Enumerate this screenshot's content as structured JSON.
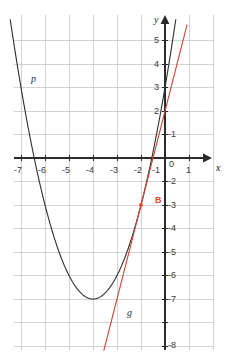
{
  "chart_data": {
    "type": "line",
    "title": "",
    "xlabel": "x",
    "ylabel": "y",
    "grid": true,
    "legend": "none",
    "xlim": [
      -7.45,
      1.45
    ],
    "ylim": [
      -8.3,
      5.7
    ],
    "xticks": [
      -7,
      -6,
      -5,
      -4,
      -3,
      -2,
      -1,
      0,
      1
    ],
    "yticks": [
      5,
      4,
      3,
      2,
      1,
      -1,
      -2,
      -3,
      -4,
      -5,
      -6,
      -7,
      -8
    ],
    "xtick_labels": [
      "-7",
      "-6",
      "-5",
      "-4",
      "-3",
      "-2",
      "-1",
      "0",
      "1"
    ],
    "ytick_labels": [
      "5",
      "4",
      "3",
      "2",
      "-1",
      "-2",
      "-3",
      "-4",
      "-5",
      "-6",
      "-7",
      "-8"
    ],
    "series": [
      {
        "name": "p",
        "label": "p",
        "kind": "parabola",
        "color": "#2f2f2f",
        "equation": "y = (x + 3)^2 - 6",
        "vertex": [
          -3,
          -6
        ],
        "x_range": [
          -6.45,
          0.45
        ],
        "points": [
          [
            -6.45,
            5.9
          ],
          [
            -6.0,
            3.0
          ],
          [
            -5.5,
            0.25
          ],
          [
            -5.0,
            -2.0
          ],
          [
            -4.5,
            -3.75
          ],
          [
            -4.0,
            -5.0
          ],
          [
            -3.5,
            -5.75
          ],
          [
            -3.0,
            -6.0
          ],
          [
            -2.5,
            -5.75
          ],
          [
            -2.0,
            -5.0
          ],
          [
            -1.5,
            -3.75
          ],
          [
            -1.0,
            -2.0
          ],
          [
            -0.5,
            0.25
          ],
          [
            0.0,
            3.0
          ],
          [
            0.45,
            5.9
          ]
        ]
      },
      {
        "name": "g",
        "label": "g",
        "kind": "line",
        "color": "#cc4433",
        "equation": "y = 4x + 2",
        "slope": 4,
        "intercept": 2,
        "x_range": [
          -2.55,
          0.92
        ],
        "points": [
          [
            -2.55,
            -8.2
          ],
          [
            0.92,
            5.68
          ]
        ]
      }
    ],
    "points_marked": [
      {
        "name": "B",
        "label": "B",
        "x": -1,
        "y": -2,
        "color": "#e8452a"
      }
    ],
    "colors": {
      "grid": "#c8c8c8",
      "axis": "#2b2b2b",
      "parabola": "#2f2f2f",
      "tangent": "#cc4433",
      "point": "#e8452a",
      "background": "#ffffff",
      "tick_text": "#3a3a3a"
    }
  },
  "labels": {
    "x_axis": "x",
    "y_axis": "y",
    "parabola": "p",
    "tangent": "g",
    "point_b": "B"
  },
  "ticks": {
    "x": [
      "-7",
      "-6",
      "-5",
      "-4",
      "-3",
      "-2",
      "-1",
      "0",
      "1"
    ],
    "y_positive": [
      "5",
      "4",
      "3",
      "2"
    ],
    "y_negative": [
      "-1",
      "-2",
      "-3",
      "-4",
      "-5",
      "-6",
      "-7",
      "-8"
    ]
  }
}
